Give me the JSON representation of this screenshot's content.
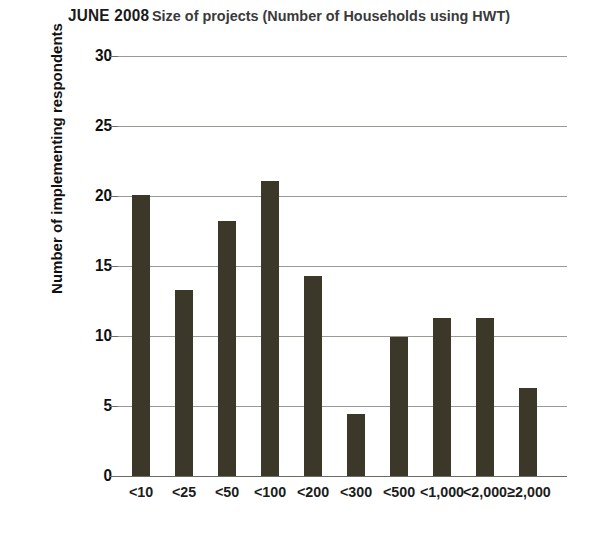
{
  "chart_data": {
    "type": "bar",
    "title_strong": "JUNE 2008",
    "title_rest": "Size of projects (Number of Households using HWT)",
    "xlabel": "",
    "ylabel": "Number of implementing respondents",
    "categories": [
      "<10",
      "<25",
      "<50",
      "<100",
      "<200",
      "<300",
      "<500",
      "<1,000",
      "<2,000",
      "≥2,000"
    ],
    "values": [
      20.1,
      13.3,
      18.2,
      21.1,
      14.3,
      4.4,
      9.9,
      11.3,
      11.3,
      6.3
    ],
    "ylim": [
      0,
      30
    ],
    "yticks": [
      0,
      5,
      10,
      15,
      20,
      25,
      30
    ],
    "ytick_labels": [
      "0",
      "5",
      "10",
      "15",
      "20",
      "25",
      "30"
    ],
    "grid": true,
    "legend": false,
    "bar_color": "#3b3729",
    "gridline_color": "#9a9a93",
    "background_color": "#ffffff"
  }
}
